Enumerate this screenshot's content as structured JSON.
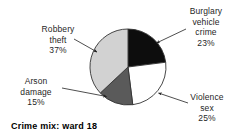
{
  "caption": "Crime mix: ward 18",
  "labels": [
    {
      "id": "burglary",
      "line1": "Burglary",
      "line2": "vehicle",
      "line3": "crime",
      "percent": "23%"
    },
    {
      "id": "robbery",
      "line1": "Robbery",
      "line2": "theft",
      "line3": "",
      "percent": "37%"
    },
    {
      "id": "arson",
      "line1": "Arson",
      "line2": "damage",
      "line3": "",
      "percent": "15%"
    },
    {
      "id": "violence",
      "line1": "Violence",
      "line2": "sex",
      "line3": "",
      "percent": "25%"
    }
  ],
  "chart_data": {
    "type": "pie",
    "title": "Crime mix: ward 18",
    "xlabel": "",
    "ylabel": "",
    "categories": [
      "Burglary vehicle crime",
      "Violence sex",
      "Arson damage",
      "Robbery theft"
    ],
    "values": [
      23,
      25,
      15,
      37
    ],
    "value_labels": [
      "23%",
      "25%",
      "15%",
      "37%"
    ],
    "units": "percent",
    "total": 100,
    "start_angle_deg": 0,
    "direction": "clockwise",
    "legend": "none",
    "grid": false,
    "colors": [
      "#0d0d0d",
      "#ffffff",
      "#5a5a5a",
      "#d2d2d2"
    ],
    "stroke": "#333333",
    "center": {
      "x": 128,
      "y": 67
    },
    "radius": 38,
    "slices": [
      {
        "name": "Burglary vehicle crime",
        "value": 23,
        "label": "23%",
        "color": "#0d0d0d",
        "start_deg": 0,
        "end_deg": 82.8
      },
      {
        "name": "Violence sex",
        "value": 25,
        "label": "25%",
        "color": "#ffffff",
        "start_deg": 82.8,
        "end_deg": 172.8
      },
      {
        "name": "Arson damage",
        "value": 15,
        "label": "15%",
        "color": "#5a5a5a",
        "start_deg": 172.8,
        "end_deg": 226.8
      },
      {
        "name": "Robbery theft",
        "value": 37,
        "label": "37%",
        "color": "#d2d2d2",
        "start_deg": 226.8,
        "end_deg": 360
      }
    ]
  }
}
